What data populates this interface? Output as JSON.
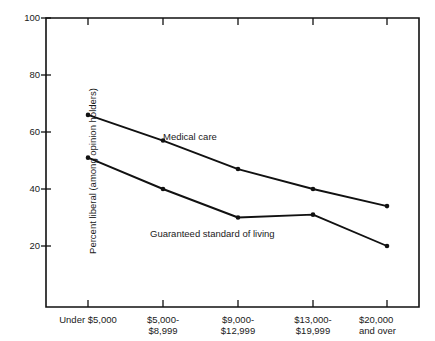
{
  "chart_data": {
    "type": "line",
    "title": "",
    "xlabel": "",
    "ylabel": "Percent liberal (among opinion holders)",
    "categories": [
      "Under $5,000",
      "$5,000-\n$8,999",
      "$9,000-\n$12,999",
      "$13,000-\n$19,999",
      "$20,000\nand over"
    ],
    "ylim": [
      0,
      100
    ],
    "yticks": [
      20,
      40,
      60,
      80,
      100
    ],
    "grid": false,
    "legend_position": "inline-annotations",
    "series": [
      {
        "name": "Medical care",
        "values": [
          66,
          57,
          47,
          40,
          34
        ],
        "color": "#111111"
      },
      {
        "name": "Guaranteed standard of living",
        "values": [
          51,
          40,
          30,
          31,
          20
        ],
        "color": "#111111"
      }
    ],
    "annotations": [
      {
        "text": "Medical care",
        "x_px": 163,
        "y_px": 131
      },
      {
        "text": "Guaranteed standard of living",
        "x_px": 150,
        "y_px": 228
      }
    ]
  },
  "axis_labels": {
    "y": [
      "100",
      "80",
      "60",
      "40",
      "20"
    ],
    "x_lines": [
      [
        "Under $5,000"
      ],
      [
        "$5,000-",
        "$8,999"
      ],
      [
        "$9,000-",
        "$12,999"
      ],
      [
        "$13,000-",
        "$19,999"
      ],
      [
        "$20,000",
        "and over"
      ]
    ]
  }
}
